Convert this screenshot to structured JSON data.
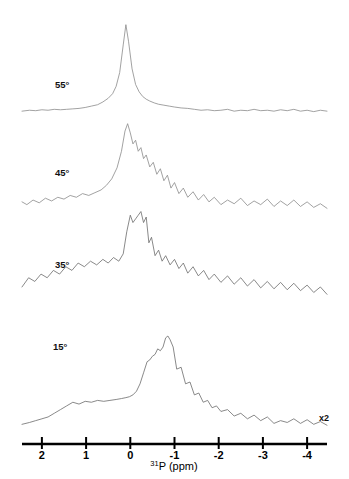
{
  "figure": {
    "type": "nmr-spectrum-stack",
    "background_color": "#ffffff",
    "trace_color": "#8a8a8a",
    "axis_color": "#000000",
    "scale_note": "x2",
    "axis_title_isotope": "31",
    "axis_title_element": "P (ppm)"
  },
  "axis": {
    "label": "31P (ppm)",
    "min_ppm": 2.45,
    "max_ppm": -4.45,
    "direction": "decreasing",
    "ticks": [
      {
        "ppm": 2,
        "label": "2"
      },
      {
        "ppm": 1,
        "label": "1"
      },
      {
        "ppm": 0,
        "label": "0"
      },
      {
        "ppm": -1,
        "label": "-1"
      },
      {
        "ppm": -2,
        "label": "-2"
      },
      {
        "ppm": -3,
        "label": "-3"
      },
      {
        "ppm": -4,
        "label": "-4"
      }
    ]
  },
  "traces": [
    {
      "label": "55°",
      "label_x": 55,
      "label_y": 88,
      "baseline_y": 113,
      "peak_ppm": 0.1,
      "description": "sharp narrow resonance near 0 ppm with flat baseline"
    },
    {
      "label": "45°",
      "label_x": 55,
      "label_y": 176,
      "baseline_y": 212,
      "peak_ppm": -0.15,
      "description": "broad asymmetric peak with downfield shoulder"
    },
    {
      "label": "35°",
      "label_x": 55,
      "label_y": 268,
      "baseline_y": 298,
      "peak_ppm": -0.3,
      "description": "sharp spike on broad noisy powder pattern"
    },
    {
      "label": "15°",
      "label_x": 53,
      "label_y": 350,
      "baseline_y": 428,
      "peak_ppm": -0.85,
      "description": "tall peak with broad upfield shoulder, x2 vertical scale"
    }
  ],
  "chart_data": {
    "type": "line",
    "title": "",
    "xlabel": "31P (ppm)",
    "ylabel": "",
    "xlim": [
      2.45,
      -4.45
    ],
    "grid": false,
    "legend": "none",
    "annotations": [
      {
        "text": "x2",
        "ppm": -3.9,
        "note": "vertical scale doubled for lowest trace"
      }
    ],
    "series": [
      {
        "name": "55°",
        "baseline_y": 113,
        "x": [
          -4.45,
          -4.3,
          -4.15,
          -4.0,
          -3.85,
          -3.7,
          -3.55,
          -3.4,
          -3.25,
          -3.1,
          -2.95,
          -2.8,
          -2.65,
          -2.5,
          -2.35,
          -2.2,
          -2.05,
          -1.9,
          -1.75,
          -1.6,
          -1.45,
          -1.3,
          -1.15,
          -1.0,
          -0.88,
          -0.76,
          -0.64,
          -0.54,
          -0.44,
          -0.36,
          -0.28,
          -0.2,
          -0.12,
          -0.04,
          0.04,
          0.1,
          0.16,
          0.24,
          0.32,
          0.4,
          0.5,
          0.62,
          0.74,
          0.88,
          1.02,
          1.16,
          1.3,
          1.44,
          1.58,
          1.72,
          1.86,
          2.0,
          2.14,
          2.28,
          2.45
        ],
        "y": [
          2,
          3,
          1.5,
          3,
          2,
          4,
          2.5,
          3.5,
          2,
          3,
          2.5,
          4,
          2.5,
          3,
          2,
          4,
          3,
          2.5,
          3.5,
          3,
          4,
          5,
          5.5,
          6.5,
          7.5,
          8.5,
          9.5,
          11,
          13,
          15,
          18,
          23,
          31,
          48,
          78,
          96,
          74,
          44,
          29,
          21,
          16,
          12,
          9,
          7.5,
          6,
          5,
          4.5,
          4,
          3.5,
          4,
          3,
          3.5,
          2.5,
          3,
          2
        ]
      },
      {
        "name": "45°",
        "baseline_y": 212,
        "x": [
          -4.45,
          -4.3,
          -4.15,
          -4.0,
          -3.85,
          -3.7,
          -3.55,
          -3.4,
          -3.25,
          -3.1,
          -2.95,
          -2.8,
          -2.65,
          -2.5,
          -2.35,
          -2.2,
          -2.05,
          -1.9,
          -1.78,
          -1.66,
          -1.54,
          -1.42,
          -1.3,
          -1.2,
          -1.1,
          -1.0,
          -0.92,
          -0.84,
          -0.76,
          -0.68,
          -0.6,
          -0.52,
          -0.44,
          -0.36,
          -0.3,
          -0.24,
          -0.18,
          -0.12,
          -0.06,
          0.0,
          0.06,
          0.12,
          0.2,
          0.3,
          0.42,
          0.54,
          0.66,
          0.8,
          0.94,
          1.08,
          1.22,
          1.36,
          1.5,
          1.64,
          1.78,
          1.92,
          2.06,
          2.2,
          2.34,
          2.45
        ],
        "y": [
          4,
          9,
          5,
          11,
          6,
          13,
          7,
          12,
          6,
          14,
          8,
          12,
          7,
          15,
          9,
          13,
          8,
          16,
          11,
          19,
          13,
          22,
          16,
          26,
          20,
          32,
          26,
          40,
          34,
          47,
          41,
          54,
          49,
          62,
          58,
          70,
          66,
          78,
          74,
          86,
          96,
          88,
          66,
          48,
          36,
          29,
          24,
          21,
          18,
          20,
          16,
          18,
          14,
          16,
          12,
          15,
          10,
          13,
          8,
          11
        ]
      },
      {
        "name": "35°",
        "baseline_y": 298,
        "x": [
          -4.45,
          -4.3,
          -4.15,
          -4.0,
          -3.85,
          -3.7,
          -3.55,
          -3.4,
          -3.25,
          -3.1,
          -2.95,
          -2.8,
          -2.65,
          -2.5,
          -2.35,
          -2.2,
          -2.05,
          -1.9,
          -1.78,
          -1.66,
          -1.54,
          -1.42,
          -1.3,
          -1.2,
          -1.1,
          -1.0,
          -0.9,
          -0.8,
          -0.72,
          -0.64,
          -0.56,
          -0.48,
          -0.42,
          -0.36,
          -0.3,
          -0.24,
          -0.18,
          -0.12,
          -0.06,
          0.0,
          0.08,
          0.16,
          0.26,
          0.38,
          0.5,
          0.62,
          0.76,
          0.9,
          1.04,
          1.18,
          1.32,
          1.46,
          1.6,
          1.74,
          1.88,
          2.02,
          2.16,
          2.3,
          2.45
        ],
        "y": [
          4,
          12,
          6,
          14,
          8,
          16,
          9,
          17,
          10,
          18,
          11,
          20,
          13,
          22,
          15,
          24,
          17,
          26,
          20,
          30,
          24,
          34,
          27,
          38,
          32,
          42,
          36,
          46,
          40,
          52,
          46,
          66,
          60,
          88,
          82,
          94,
          90,
          86,
          82,
          90,
          72,
          48,
          40,
          44,
          38,
          42,
          36,
          40,
          34,
          38,
          30,
          34,
          26,
          30,
          22,
          26,
          18,
          22,
          12
        ]
      },
      {
        "name": "15°",
        "baseline_y": 428,
        "x": [
          -4.45,
          -4.3,
          -4.15,
          -4.0,
          -3.85,
          -3.7,
          -3.55,
          -3.4,
          -3.25,
          -3.1,
          -2.95,
          -2.8,
          -2.65,
          -2.5,
          -2.35,
          -2.2,
          -2.05,
          -1.95,
          -1.85,
          -1.75,
          -1.65,
          -1.55,
          -1.45,
          -1.35,
          -1.25,
          -1.15,
          -1.05,
          -0.97,
          -0.9,
          -0.85,
          -0.8,
          -0.74,
          -0.68,
          -0.62,
          -0.56,
          -0.5,
          -0.44,
          -0.38,
          -0.3,
          -0.22,
          -0.14,
          -0.06,
          0.02,
          0.1,
          0.2,
          0.32,
          0.46,
          0.6,
          0.74,
          0.88,
          1.02,
          1.16,
          1.3,
          1.44,
          1.58,
          1.72,
          1.86,
          2.0,
          2.14,
          2.28,
          2.45
        ],
        "y": [
          3,
          7,
          4,
          9,
          5,
          10,
          6,
          8,
          5,
          12,
          8,
          14,
          10,
          16,
          13,
          20,
          18,
          24,
          22,
          30,
          28,
          38,
          36,
          50,
          48,
          66,
          64,
          88,
          96,
          100,
          98,
          88,
          84,
          86,
          80,
          78,
          74,
          72,
          60,
          48,
          40,
          36,
          34,
          33,
          32,
          31,
          30,
          29,
          30,
          28,
          29,
          26,
          28,
          24,
          20,
          16,
          12,
          10,
          8,
          6,
          4
        ]
      }
    ]
  }
}
